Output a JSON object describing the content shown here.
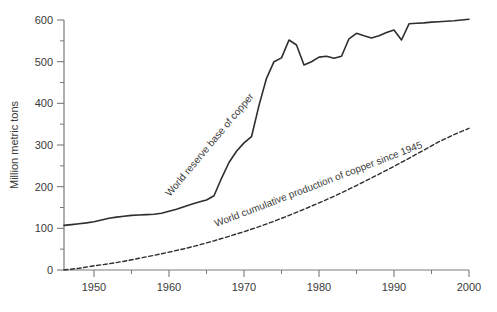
{
  "chart_data": {
    "type": "line",
    "title": "",
    "xlabel": "",
    "ylabel": "Million metric tons",
    "xlim": [
      1946,
      2000
    ],
    "ylim": [
      0,
      600
    ],
    "grid": false,
    "legend_position": "inline-rotated-labels",
    "x_major_ticks": [
      1950,
      1960,
      1970,
      1980,
      1990,
      2000
    ],
    "x_minor_ticks": [
      1955,
      1965,
      1975,
      1985,
      1995
    ],
    "y_major_ticks": [
      0,
      100,
      200,
      300,
      400,
      500,
      600
    ],
    "y_minor_ticks": [
      50,
      150,
      250,
      350,
      450,
      550
    ],
    "colors": {
      "curve": "#2e2e2e",
      "axis": "#7a7a7a",
      "text": "#3a3a3a",
      "background": "#ffffff"
    },
    "series": [
      {
        "name": "World reserve base of copper",
        "style": "solid",
        "x": [
          1946,
          1947,
          1948,
          1949,
          1950,
          1951,
          1952,
          1953,
          1954,
          1955,
          1956,
          1957,
          1958,
          1959,
          1960,
          1961,
          1962,
          1963,
          1964,
          1965,
          1966,
          1967,
          1968,
          1969,
          1970,
          1971,
          1972,
          1973,
          1974,
          1975,
          1976,
          1977,
          1978,
          1979,
          1980,
          1981,
          1982,
          1983,
          1984,
          1985,
          1986,
          1987,
          1988,
          1989,
          1990,
          1991,
          1992,
          1993,
          1994,
          1995,
          1996,
          1997,
          1998,
          1999,
          2000
        ],
        "values": [
          107,
          109,
          111,
          113,
          116,
          120,
          124,
          127,
          129,
          131,
          132,
          133,
          134,
          136,
          141,
          146,
          152,
          158,
          163,
          168,
          178,
          220,
          258,
          285,
          305,
          320,
          395,
          460,
          500,
          509,
          552,
          540,
          492,
          500,
          511,
          513,
          508,
          513,
          555,
          568,
          562,
          557,
          562,
          570,
          576,
          552,
          591,
          592,
          593,
          595,
          596,
          597,
          598,
          600,
          602
        ]
      },
      {
        "name": "World cumulative production of copper since 1945",
        "style": "dashed",
        "x": [
          1946,
          1948,
          1950,
          1952,
          1954,
          1956,
          1958,
          1960,
          1962,
          1964,
          1966,
          1968,
          1970,
          1972,
          1974,
          1976,
          1978,
          1980,
          1982,
          1984,
          1986,
          1988,
          1990,
          1992,
          1994,
          1996,
          1998,
          2000
        ],
        "values": [
          0,
          4,
          10,
          15,
          21,
          28,
          35,
          43,
          51,
          60,
          70,
          81,
          92,
          104,
          117,
          131,
          146,
          161,
          177,
          194,
          212,
          230,
          249,
          268,
          288,
          308,
          325,
          340
        ]
      }
    ]
  }
}
